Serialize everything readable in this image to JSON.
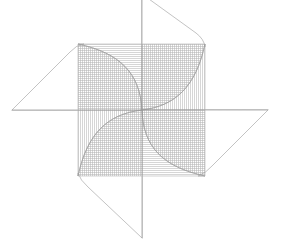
{
  "figure": {
    "type": "line-drawing",
    "background_color": "#ffffff",
    "canvas": {
      "width": 281,
      "height": 247
    },
    "stroke_color": "#9a9a9a",
    "stroke_width": 0.6,
    "hatch_color": "#b4b4b4",
    "hatch_width": 0.55,
    "hatch_spacing": 2,
    "center": {
      "x": 142,
      "y": 110
    },
    "hatch_square": {
      "x0": 78,
      "y0": 44,
      "x1": 205,
      "y1": 176
    },
    "blades": [
      {
        "name": "blade-top",
        "rotation_deg": 0,
        "tip": {
          "x": 142,
          "y": -6
        },
        "corner": {
          "x": 205,
          "y": 44
        },
        "hatch": "horizontal",
        "hatch_quadrant": "top-left"
      },
      {
        "name": "blade-right",
        "rotation_deg": 90,
        "tip": {
          "x": 268,
          "y": 110
        },
        "corner": {
          "x": 205,
          "y": 176
        },
        "hatch": "vertical",
        "hatch_quadrant": "top-right"
      },
      {
        "name": "blade-bottom",
        "rotation_deg": 180,
        "tip": {
          "x": 142,
          "y": 238
        },
        "corner": {
          "x": 78,
          "y": 176
        },
        "hatch": "horizontal",
        "hatch_quadrant": "bottom-right"
      },
      {
        "name": "blade-left",
        "rotation_deg": 270,
        "tip": {
          "x": 12,
          "y": 110
        },
        "corner": {
          "x": 78,
          "y": 44
        },
        "hatch": "vertical",
        "hatch_quadrant": "bottom-left"
      }
    ],
    "spokes": [
      {
        "name": "spoke-vertical",
        "x1": 142,
        "y1": -6,
        "x2": 142,
        "y2": 238
      },
      {
        "name": "spoke-horizontal",
        "x1": 12,
        "y1": 110,
        "x2": 268,
        "y2": 110
      }
    ]
  }
}
